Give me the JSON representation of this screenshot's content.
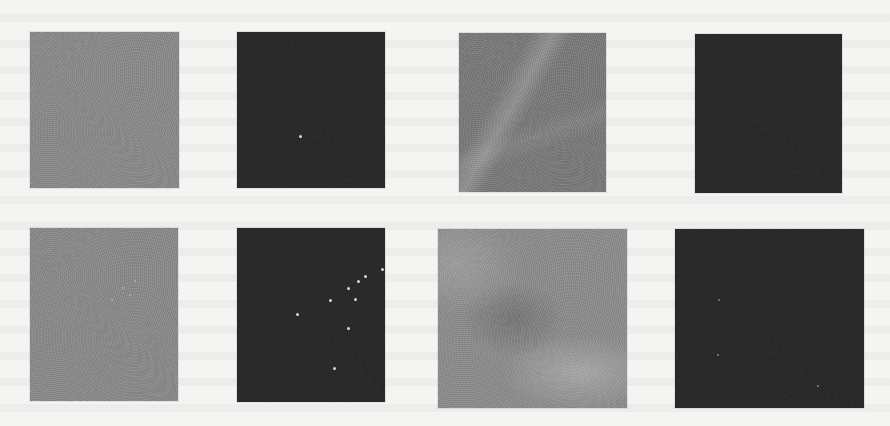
{
  "figure": {
    "layout": "2 rows x 4 columns grid of grayscale image patches",
    "panels": [
      {
        "row": 1,
        "col": 1,
        "appearance": "uniform mid-gray texture",
        "color": "#8a8a8a",
        "box": [
          30,
          32,
          149,
          156
        ]
      },
      {
        "row": 1,
        "col": 2,
        "appearance": "dark (near-black) texture",
        "color": "#2a2a2a",
        "box": [
          237,
          32,
          148,
          156
        ]
      },
      {
        "row": 1,
        "col": 3,
        "appearance": "mid-gray texture with diagonal bright fiber",
        "color": "#7b7b7b",
        "box": [
          459,
          33,
          147,
          159
        ]
      },
      {
        "row": 1,
        "col": 4,
        "appearance": "dark (near-black) texture",
        "color": "#2a2a2a",
        "box": [
          695,
          34,
          147,
          159
        ]
      },
      {
        "row": 2,
        "col": 1,
        "appearance": "mid-gray texture with faint bright cluster",
        "color": "#8a8a8a",
        "box": [
          30,
          228,
          148,
          173
        ]
      },
      {
        "row": 2,
        "col": 2,
        "appearance": "dark texture with scattered bright specks",
        "color": "#2a2a2a",
        "box": [
          237,
          228,
          148,
          174
        ]
      },
      {
        "row": 2,
        "col": 3,
        "appearance": "cloudy mid-gray texture",
        "color": "#8d8d8d",
        "box": [
          438,
          229,
          189,
          179
        ]
      },
      {
        "row": 2,
        "col": 4,
        "appearance": "dark texture with a few faint specks",
        "color": "#2a2a2a",
        "box": [
          675,
          229,
          189,
          179
        ]
      }
    ]
  },
  "colors": {
    "page_background": "#f4f4f2",
    "mid_gray": "#8a8a8a",
    "dark": "#2a2a2a",
    "speck": "#d8d8d8"
  }
}
